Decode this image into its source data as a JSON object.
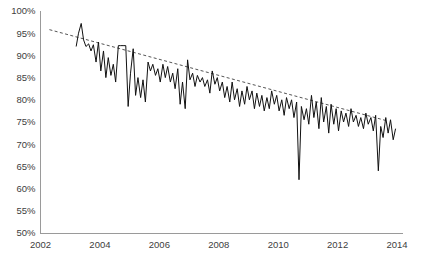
{
  "chart_data": {
    "type": "line",
    "title": "",
    "subtitle": "",
    "xlabel": "",
    "ylabel": "",
    "xlim": [
      2002,
      2014.2
    ],
    "ylim": [
      50,
      100
    ],
    "grid": false,
    "legend": "none",
    "y_tick_labels": [
      "100%",
      "95%",
      "90%",
      "85%",
      "80%",
      "75%",
      "70%",
      "65%",
      "60%",
      "55%",
      "50%"
    ],
    "y_tick_values": [
      100,
      95,
      90,
      85,
      80,
      75,
      70,
      65,
      60,
      55,
      50
    ],
    "x_tick_labels": [
      "2002",
      "2004",
      "2006",
      "2008",
      "2010",
      "2012",
      "2014"
    ],
    "x_tick_values": [
      2002,
      2004,
      2006,
      2008,
      2010,
      2012,
      2014
    ],
    "series": [
      {
        "name": "observed",
        "style": "solid",
        "color": "#111111",
        "x": [
          2003.2,
          2003.28,
          2003.37,
          2003.45,
          2003.53,
          2003.62,
          2003.7,
          2003.78,
          2003.87,
          2003.95,
          2004.03,
          2004.12,
          2004.2,
          2004.28,
          2004.37,
          2004.45,
          2004.53,
          2004.62,
          2004.7,
          2004.78,
          2004.87,
          2004.95,
          2005.03,
          2005.12,
          2005.2,
          2005.28,
          2005.37,
          2005.45,
          2005.53,
          2005.62,
          2005.7,
          2005.78,
          2005.87,
          2005.95,
          2006.03,
          2006.12,
          2006.2,
          2006.28,
          2006.37,
          2006.45,
          2006.53,
          2006.62,
          2006.7,
          2006.78,
          2006.87,
          2006.95,
          2007.03,
          2007.12,
          2007.2,
          2007.28,
          2007.37,
          2007.45,
          2007.53,
          2007.62,
          2007.7,
          2007.78,
          2007.87,
          2007.95,
          2008.03,
          2008.12,
          2008.2,
          2008.28,
          2008.37,
          2008.45,
          2008.53,
          2008.62,
          2008.7,
          2008.78,
          2008.87,
          2008.95,
          2009.03,
          2009.12,
          2009.2,
          2009.28,
          2009.37,
          2009.45,
          2009.53,
          2009.62,
          2009.7,
          2009.78,
          2009.87,
          2009.95,
          2010.03,
          2010.12,
          2010.2,
          2010.28,
          2010.37,
          2010.45,
          2010.53,
          2010.62,
          2010.7,
          2010.78,
          2010.87,
          2010.95,
          2011.03,
          2011.12,
          2011.2,
          2011.28,
          2011.37,
          2011.45,
          2011.53,
          2011.62,
          2011.7,
          2011.78,
          2011.87,
          2011.95,
          2012.03,
          2012.12,
          2012.2,
          2012.28,
          2012.37,
          2012.45,
          2012.53,
          2012.62,
          2012.7,
          2012.78,
          2012.87,
          2012.95,
          2013.03,
          2013.12,
          2013.2,
          2013.28,
          2013.37,
          2013.45,
          2013.53,
          2013.62,
          2013.7,
          2013.78,
          2013.87,
          2013.95
        ],
        "y": [
          92.0,
          95.0,
          97.2,
          93.5,
          92.0,
          92.6,
          91.0,
          92.4,
          88.5,
          93.0,
          86.5,
          91.0,
          85.0,
          89.5,
          85.5,
          88.0,
          84.0,
          92.2,
          92.2,
          92.2,
          92.2,
          78.5,
          86.0,
          91.5,
          81.0,
          85.0,
          80.5,
          84.5,
          79.5,
          88.5,
          86.5,
          88.0,
          85.5,
          87.0,
          84.0,
          88.0,
          85.0,
          87.5,
          84.0,
          86.0,
          82.5,
          87.0,
          79.0,
          84.0,
          78.0,
          89.0,
          84.5,
          86.0,
          83.0,
          85.5,
          84.0,
          85.0,
          83.0,
          84.5,
          81.5,
          86.5,
          83.5,
          85.0,
          82.0,
          84.0,
          80.5,
          83.0,
          79.5,
          84.0,
          80.0,
          82.5,
          78.5,
          82.0,
          79.0,
          83.0,
          80.0,
          82.0,
          78.0,
          81.5,
          78.5,
          81.0,
          77.5,
          80.5,
          78.0,
          82.0,
          79.0,
          81.0,
          77.5,
          80.0,
          76.5,
          80.5,
          78.0,
          80.0,
          76.0,
          79.5,
          62.0,
          78.5,
          75.5,
          78.0,
          74.5,
          81.0,
          76.0,
          79.5,
          73.5,
          80.5,
          75.0,
          78.5,
          72.5,
          79.0,
          74.5,
          78.0,
          73.0,
          77.5,
          75.0,
          77.0,
          74.0,
          78.0,
          75.0,
          76.5,
          74.0,
          76.0,
          73.5,
          77.0,
          74.5,
          76.0,
          73.0,
          76.5,
          64.0,
          74.0,
          71.5,
          76.0,
          72.5,
          75.5,
          71.0,
          73.5
        ]
      },
      {
        "name": "trend",
        "style": "dashed",
        "color": "#555555",
        "x": [
          2002.3,
          2013.7
        ],
        "y": [
          95.8,
          75.2
        ]
      }
    ]
  }
}
